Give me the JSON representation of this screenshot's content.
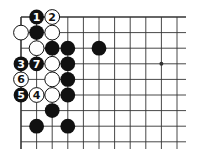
{
  "diagram": {
    "type": "go-board-fragment",
    "grid": {
      "columns": 11,
      "rows": 9,
      "origin_x": 21,
      "origin_y": 17,
      "spacing": 15.6,
      "right_extend": 186,
      "bottom_extend": 149,
      "top_edge": true,
      "left_edge": true
    },
    "star_points": [
      {
        "col": 9,
        "row": 3
      }
    ],
    "stones": [
      {
        "col": 1,
        "row": 0,
        "color": "black",
        "label": "1"
      },
      {
        "col": 2,
        "row": 0,
        "color": "white",
        "label": "2"
      },
      {
        "col": 0,
        "row": 1,
        "color": "white",
        "label": ""
      },
      {
        "col": 1,
        "row": 1,
        "color": "black",
        "label": ""
      },
      {
        "col": 2,
        "row": 1,
        "color": "white",
        "label": ""
      },
      {
        "col": 1,
        "row": 2,
        "color": "white",
        "label": ""
      },
      {
        "col": 2,
        "row": 2,
        "color": "black",
        "label": ""
      },
      {
        "col": 3,
        "row": 2,
        "color": "black",
        "label": ""
      },
      {
        "col": 5,
        "row": 2,
        "color": "black",
        "label": ""
      },
      {
        "col": 0,
        "row": 3,
        "color": "black",
        "label": "3"
      },
      {
        "col": 1,
        "row": 3,
        "color": "black",
        "label": "7"
      },
      {
        "col": 2,
        "row": 3,
        "color": "white",
        "label": ""
      },
      {
        "col": 3,
        "row": 3,
        "color": "black",
        "label": ""
      },
      {
        "col": 0,
        "row": 4,
        "color": "white",
        "label": "6"
      },
      {
        "col": 2,
        "row": 4,
        "color": "white",
        "label": ""
      },
      {
        "col": 3,
        "row": 4,
        "color": "black",
        "label": ""
      },
      {
        "col": 0,
        "row": 5,
        "color": "black",
        "label": "5"
      },
      {
        "col": 1,
        "row": 5,
        "color": "white",
        "label": "4"
      },
      {
        "col": 2,
        "row": 5,
        "color": "white",
        "label": ""
      },
      {
        "col": 3,
        "row": 5,
        "color": "black",
        "label": ""
      },
      {
        "col": 2,
        "row": 6,
        "color": "black",
        "label": ""
      },
      {
        "col": 1,
        "row": 7,
        "color": "black",
        "label": ""
      },
      {
        "col": 3,
        "row": 7,
        "color": "black",
        "label": ""
      }
    ],
    "colors": {
      "line": "#333333",
      "black_stone": "#111111",
      "white_stone": "#ffffff",
      "background": "#ffffff"
    }
  }
}
